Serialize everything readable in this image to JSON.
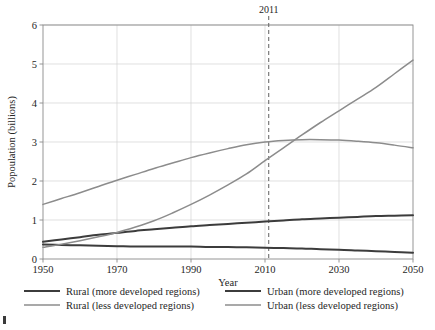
{
  "chart_data": {
    "type": "line",
    "title": "",
    "xlabel": "Year",
    "ylabel": "Popoulation (billions)",
    "xlim": [
      1950,
      2050
    ],
    "ylim": [
      0,
      6
    ],
    "xticks": [
      1950,
      1970,
      1990,
      2010,
      2030,
      2050
    ],
    "yticks": [
      0,
      1,
      2,
      3,
      4,
      5,
      6
    ],
    "grid": true,
    "legend_position": "bottom",
    "x": [
      1950,
      1955,
      1960,
      1965,
      1970,
      1975,
      1980,
      1985,
      1990,
      1995,
      2000,
      2005,
      2010,
      2015,
      2020,
      2025,
      2030,
      2035,
      2040,
      2045,
      2050
    ],
    "series": [
      {
        "name": "Rural (more developed regions)",
        "color": "#3c3c3c",
        "width": 2.0,
        "values": [
          0.37,
          0.36,
          0.35,
          0.34,
          0.33,
          0.32,
          0.32,
          0.32,
          0.32,
          0.31,
          0.31,
          0.3,
          0.29,
          0.28,
          0.27,
          0.25,
          0.24,
          0.22,
          0.2,
          0.18,
          0.16
        ]
      },
      {
        "name": "Urban (more developed regions)",
        "color": "#3c3c3c",
        "width": 2.0,
        "values": [
          0.44,
          0.5,
          0.56,
          0.62,
          0.67,
          0.72,
          0.76,
          0.8,
          0.84,
          0.87,
          0.9,
          0.93,
          0.96,
          0.99,
          1.02,
          1.04,
          1.06,
          1.08,
          1.1,
          1.11,
          1.12
        ]
      },
      {
        "name": "Rural (less developed regions)",
        "color": "#8c8c8c",
        "width": 1.5,
        "values": [
          1.4,
          1.55,
          1.7,
          1.86,
          2.02,
          2.17,
          2.32,
          2.46,
          2.6,
          2.72,
          2.83,
          2.93,
          3.0,
          3.04,
          3.06,
          3.06,
          3.05,
          3.02,
          2.98,
          2.92,
          2.85
        ]
      },
      {
        "name": "Urban (less developed regions)",
        "color": "#8c8c8c",
        "width": 1.5,
        "values": [
          0.3,
          0.38,
          0.47,
          0.57,
          0.68,
          0.82,
          0.98,
          1.18,
          1.4,
          1.64,
          1.9,
          2.18,
          2.52,
          2.85,
          3.18,
          3.5,
          3.8,
          4.1,
          4.4,
          4.75,
          5.1
        ]
      }
    ],
    "annotations": [
      {
        "label": "2011",
        "x": 2011,
        "style": "dashed-vertical-line",
        "color": "#6f6f6f"
      }
    ]
  },
  "legend": {
    "items": [
      {
        "label": "Rural (more developed regions)",
        "color": "#3c3c3c",
        "width": 2.0
      },
      {
        "label": "Urban (more developed regions)",
        "color": "#3c3c3c",
        "width": 2.0
      },
      {
        "label": "Rural (less developed regions)",
        "color": "#8c8c8c",
        "width": 1.5
      },
      {
        "label": "Urban (less developed regions)",
        "color": "#8c8c8c",
        "width": 1.5
      }
    ]
  },
  "colors": {
    "more_developed": "#3c3c3c",
    "less_developed": "#8c8c8c",
    "grid": "#d2d2d2",
    "frame": "#8a8a8a",
    "text": "#262626",
    "background": "#ffffff"
  }
}
